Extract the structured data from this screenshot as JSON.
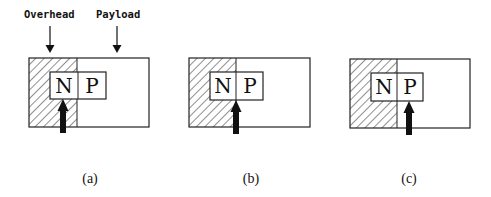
{
  "labels": {
    "overhead": "Overhead",
    "payload": "Payload"
  },
  "panels": [
    {
      "id": "a",
      "caption": "(a)",
      "cells": [
        "N",
        "P"
      ],
      "pointer": "inside N (overhead)"
    },
    {
      "id": "b",
      "caption": "(b)",
      "cells": [
        "N",
        "P"
      ],
      "pointer": "boundary between N and P"
    },
    {
      "id": "c",
      "caption": "(c)",
      "cells": [
        "N",
        "P"
      ],
      "pointer": "inside P (payload)"
    }
  ],
  "colors": {
    "stroke": "#222222",
    "hatch": "#333333",
    "background": "#ffffff"
  }
}
